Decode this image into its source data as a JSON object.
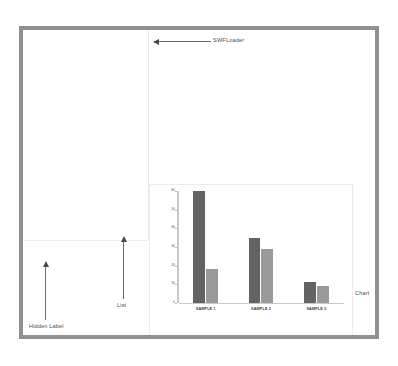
{
  "window": {
    "frame_color": "#8e9094",
    "background": "#ffffff"
  },
  "annotations": [
    {
      "id": "swfloader",
      "label": "SWFLoader"
    },
    {
      "id": "list",
      "label": "List"
    },
    {
      "id": "chart",
      "label": "Chart"
    },
    {
      "id": "hidden",
      "label": "Hidden Label"
    }
  ],
  "chart_data": {
    "type": "bar",
    "title": "",
    "xlabel": "",
    "ylabel": "",
    "categories": [
      "SAMPLE 1",
      "SAMPLE 2",
      "SAMPLE 3"
    ],
    "series": [
      {
        "name": "Series 1",
        "color": "#636363",
        "values": [
          60,
          35,
          11
        ]
      },
      {
        "name": "Series 2",
        "color": "#9a9a9a",
        "values": [
          18,
          29,
          9
        ]
      }
    ],
    "ylim": [
      0,
      60
    ],
    "yticks": [
      0,
      10,
      20,
      30,
      40,
      50,
      60
    ],
    "ytick_labels": [
      "0",
      "10",
      "20",
      "30",
      "40",
      "50",
      "60"
    ],
    "grid": false,
    "legend": "none"
  }
}
